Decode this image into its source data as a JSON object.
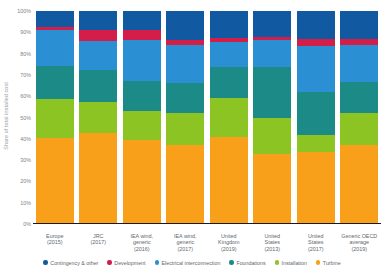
{
  "chart_data": {
    "type": "bar",
    "stacked": true,
    "stack_mode": "percent",
    "title": "",
    "subtitle": "",
    "xlabel": "",
    "ylabel": "Share of total installed cost",
    "ylim": [
      0,
      100
    ],
    "yticks": [
      "0%",
      "10%",
      "20%",
      "30%",
      "40%",
      "50%",
      "60%",
      "70%",
      "80%",
      "90%",
      "100%"
    ],
    "ytick_values": [
      0,
      10,
      20,
      30,
      40,
      50,
      60,
      70,
      80,
      90,
      100
    ],
    "grid": false,
    "legend_position": "bottom",
    "categories": [
      "Europe\n(2015)",
      "JRC\n(2017)",
      "IEA wind,\ngeneric\n(2016)",
      "IEA wind,\ngeneric\n(2017)",
      "United\nKingdom\n(2019)",
      "United\nStates\n(2013)",
      "United\nStates\n(2017)",
      "Generic OECD\naverage\n(2019)"
    ],
    "series": [
      {
        "name": "Turbine",
        "color": "#f8a01a",
        "values": [
          40.5,
          42.5,
          39.5,
          37.0,
          41.0,
          33.0,
          34.0,
          37.0
        ]
      },
      {
        "name": "Installation",
        "color": "#8cc423",
        "values": [
          18.0,
          15.0,
          13.5,
          15.0,
          18.0,
          17.0,
          8.0,
          15.0
        ]
      },
      {
        "name": "Foundations",
        "color": "#1c8a87",
        "values": [
          15.5,
          15.0,
          14.0,
          14.0,
          14.5,
          23.5,
          20.0,
          14.5
        ]
      },
      {
        "name": "Electrical interconnection",
        "color": "#2b8fd4",
        "values": [
          17.0,
          13.5,
          19.5,
          18.0,
          12.0,
          13.0,
          21.5,
          17.5
        ]
      },
      {
        "name": "Development",
        "color": "#d31e49",
        "values": [
          1.5,
          5.0,
          4.5,
          2.5,
          2.0,
          1.5,
          3.5,
          3.0
        ]
      },
      {
        "name": "Contingency & other",
        "color": "#1159a0",
        "values": [
          7.5,
          9.0,
          9.0,
          13.5,
          12.5,
          12.0,
          13.0,
          13.0
        ]
      }
    ]
  },
  "legend": {
    "items": [
      {
        "label": "Contingency & other",
        "color": "#1159a0"
      },
      {
        "label": "Development",
        "color": "#d31e49"
      },
      {
        "label": "Electrical interconnection",
        "color": "#2b8fd4"
      },
      {
        "label": "Foundations",
        "color": "#1c8a87"
      },
      {
        "label": "Installation",
        "color": "#8cc423"
      },
      {
        "label": "Turbine",
        "color": "#f8a01a"
      }
    ]
  },
  "axis": {
    "y_title": "Share of total installed cost"
  }
}
